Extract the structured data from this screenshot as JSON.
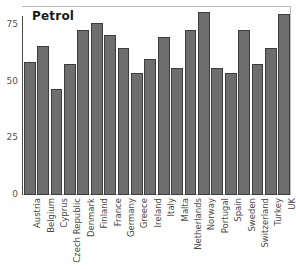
{
  "chart_data": {
    "type": "bar",
    "title": "Petrol",
    "xlabel": "",
    "ylabel": "",
    "ylim": [
      0,
      87
    ],
    "yticks": [
      0,
      25,
      50,
      75
    ],
    "grid": false,
    "legend": "none",
    "bar_color": "#6e6e6e",
    "bar_edge_color": "#3d3d3d",
    "categories": [
      "Austria",
      "Belgium",
      "Cyprus",
      "Czech Republic",
      "Denmark",
      "Finland",
      "France",
      "Germany",
      "Greece",
      "Ireland",
      "Italy",
      "Malta",
      "Netherlands",
      "Norway",
      "Portugal",
      "Spain",
      "Sweden",
      "Switzerland",
      "Turkey",
      "UK"
    ],
    "values": [
      59,
      66,
      47,
      58,
      73,
      76,
      71,
      65,
      54,
      60,
      70,
      56,
      73,
      81,
      56,
      54,
      73,
      58,
      65,
      80
    ]
  }
}
